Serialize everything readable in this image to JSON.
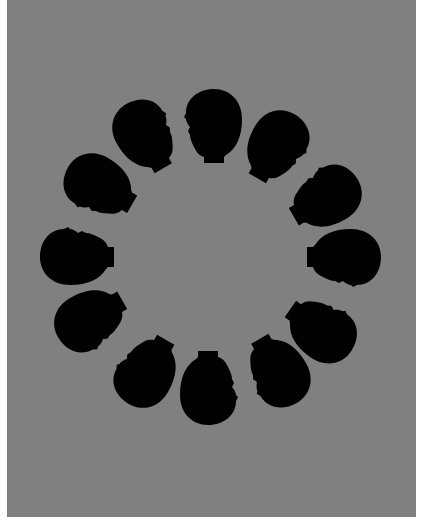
{
  "figure": {
    "background_color": "#ffffff",
    "panel_color": "#808080",
    "silhouette_color": "#000000",
    "ring_center": [
      212,
      257
    ],
    "head_count": 12,
    "heads": [
      {
        "id": 1,
        "cx": 212,
        "cy": 127,
        "rotation": 0,
        "mirror": false
      },
      {
        "id": 2,
        "cx": 277,
        "cy": 148,
        "rotation": 30,
        "mirror": true
      },
      {
        "id": 3,
        "cx": 324,
        "cy": 197,
        "rotation": 60,
        "mirror": false
      },
      {
        "id": 4,
        "cx": 343,
        "cy": 259,
        "rotation": 90,
        "mirror": true
      },
      {
        "id": 5,
        "cx": 321,
        "cy": 328,
        "rotation": 125,
        "mirror": false
      },
      {
        "id": 6,
        "cx": 276,
        "cy": 371,
        "rotation": 150,
        "mirror": true
      },
      {
        "id": 7,
        "cx": 210,
        "cy": 387,
        "rotation": 180,
        "mirror": false
      },
      {
        "id": 8,
        "cx": 146,
        "cy": 370,
        "rotation": 210,
        "mirror": true
      },
      {
        "id": 9,
        "cx": 92,
        "cy": 320,
        "rotation": 240,
        "mirror": false
      },
      {
        "id": 10,
        "cx": 78,
        "cy": 255,
        "rotation": 270,
        "mirror": true
      },
      {
        "id": 11,
        "cx": 100,
        "cy": 188,
        "rotation": 300,
        "mirror": false
      },
      {
        "id": 12,
        "cx": 147,
        "cy": 136,
        "rotation": 330,
        "mirror": true
      }
    ]
  }
}
